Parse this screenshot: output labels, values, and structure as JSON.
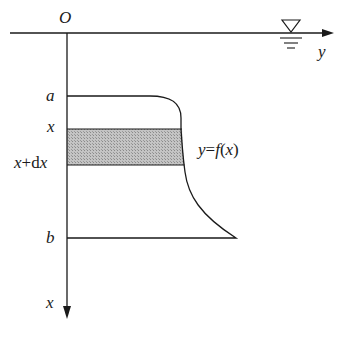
{
  "diagram": {
    "origin_label": "O",
    "horizontal_axis_label": "y",
    "vertical_axis_label": "x",
    "water_level_symbol": "water-surface-triangle",
    "depth_labels": {
      "a": "a",
      "x": "x",
      "x_dx": "x+dx",
      "b": "b"
    },
    "curve_label": "y=f(x)",
    "colors": {
      "line": "#1a1a1a",
      "shaded_strip": "#b8b8b8",
      "background": "#ffffff"
    }
  }
}
